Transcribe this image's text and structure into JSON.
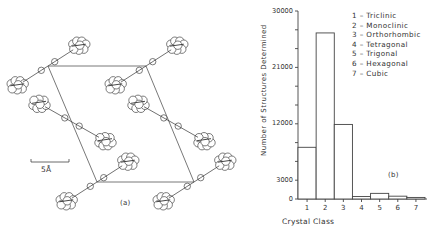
{
  "figure": {
    "panel_a": {
      "label": "(a)",
      "scale_bar_label": "5Å",
      "unit_cell": {
        "corners": [
          [
            48,
            66
          ],
          [
            146,
            66
          ],
          [
            194,
            182
          ],
          [
            97,
            182
          ]
        ]
      }
    },
    "panel_b": {
      "label": "(b)"
    }
  },
  "chart_data": {
    "type": "bar",
    "title": "",
    "xlabel": "Crystal Class",
    "ylabel": "Number of Structures Determined",
    "categories": [
      "1",
      "2",
      "3",
      "4",
      "5",
      "6",
      "7"
    ],
    "values": [
      8250,
      26500,
      11900,
      400,
      900,
      450,
      250
    ],
    "ylim": [
      0,
      30000
    ],
    "yticks_labeled": [
      0,
      3000,
      12000,
      21000,
      30000
    ],
    "yticks_minor": [
      6000,
      9000,
      15000,
      18000,
      24000,
      27000
    ],
    "grid": false,
    "legend_position": "upper right",
    "legend": [
      {
        "key": "1",
        "label": "1 – Triclinic"
      },
      {
        "key": "2",
        "label": "2 – Monoclinic"
      },
      {
        "key": "3",
        "label": "3 – Orthorhombic"
      },
      {
        "key": "4",
        "label": "4 – Tetragonal"
      },
      {
        "key": "5",
        "label": "5 – Trigonal"
      },
      {
        "key": "6",
        "label": "6 – Hexagonal"
      },
      {
        "key": "7",
        "label": "7 – Cubic"
      }
    ],
    "annotation": "(b)"
  }
}
